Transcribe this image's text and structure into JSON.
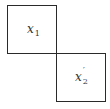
{
  "diagram": {
    "boxes": [
      {
        "variable": "x",
        "subscript": "1",
        "prime": ""
      },
      {
        "variable": "x",
        "subscript": "2",
        "prime": "′"
      }
    ],
    "colors": {
      "stroke": "#2a2a2a",
      "text": "#333333",
      "background": "#ffffff"
    }
  }
}
